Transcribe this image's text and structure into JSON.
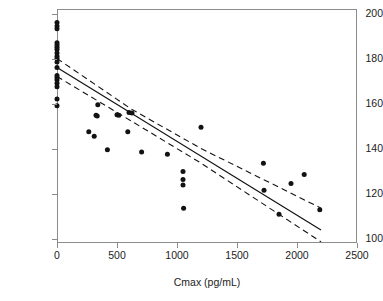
{
  "figure": {
    "title": "",
    "background": "#ffffff"
  },
  "axes": {
    "x": {
      "label": "Cmax (pg/mL)",
      "ticks": [
        0,
        500,
        1000,
        1500,
        2000,
        2500
      ],
      "tick_labels": [
        "0",
        "500",
        "1000",
        "1500",
        "2000",
        "2500"
      ],
      "min": 0,
      "max": 2500
    },
    "y": {
      "label": "Glucose level (mg/dL)",
      "ticks": [
        100,
        120,
        140,
        160,
        180,
        200
      ],
      "tick_labels": [
        "100",
        "120",
        "140",
        "160",
        "180",
        "200"
      ],
      "min": 98,
      "max": 202
    }
  },
  "chart_data": {
    "type": "scatter",
    "title": "",
    "xlabel": "Cmax (pg/mL)",
    "ylabel": "Glucose level (mg/dL)",
    "xlim": [
      0,
      2500
    ],
    "ylim": [
      98,
      202
    ],
    "grid": false,
    "legend": null,
    "marker_color": "#121212",
    "line_color": "#121212",
    "points": [
      {
        "x": 0,
        "y": 196.0
      },
      {
        "x": 0,
        "y": 194.5
      },
      {
        "x": 0,
        "y": 193.2
      },
      {
        "x": 0,
        "y": 187.0
      },
      {
        "x": 0,
        "y": 186.0
      },
      {
        "x": 0,
        "y": 185.0
      },
      {
        "x": 0,
        "y": 184.0
      },
      {
        "x": 0,
        "y": 182.5
      },
      {
        "x": 0,
        "y": 181.0
      },
      {
        "x": 0,
        "y": 180.0
      },
      {
        "x": 0,
        "y": 178.5
      },
      {
        "x": 0,
        "y": 176.0
      },
      {
        "x": 0,
        "y": 172.5
      },
      {
        "x": 0,
        "y": 171.5
      },
      {
        "x": 0,
        "y": 170.5
      },
      {
        "x": 0,
        "y": 169.0
      },
      {
        "x": 0,
        "y": 167.5
      },
      {
        "x": 0,
        "y": 162.0
      },
      {
        "x": 0,
        "y": 159.0
      },
      {
        "x": 265,
        "y": 147.5
      },
      {
        "x": 310,
        "y": 145.5
      },
      {
        "x": 325,
        "y": 154.8
      },
      {
        "x": 335,
        "y": 154.5
      },
      {
        "x": 340,
        "y": 159.5
      },
      {
        "x": 420,
        "y": 139.5
      },
      {
        "x": 500,
        "y": 155.0
      },
      {
        "x": 515,
        "y": 154.8
      },
      {
        "x": 590,
        "y": 147.5
      },
      {
        "x": 600,
        "y": 156.0
      },
      {
        "x": 625,
        "y": 155.8
      },
      {
        "x": 705,
        "y": 138.5
      },
      {
        "x": 920,
        "y": 137.5
      },
      {
        "x": 1050,
        "y": 129.8
      },
      {
        "x": 1050,
        "y": 126.2
      },
      {
        "x": 1050,
        "y": 123.8
      },
      {
        "x": 1055,
        "y": 113.5
      },
      {
        "x": 1200,
        "y": 149.5
      },
      {
        "x": 1720,
        "y": 133.5
      },
      {
        "x": 1725,
        "y": 121.5
      },
      {
        "x": 1850,
        "y": 110.8
      },
      {
        "x": 1950,
        "y": 124.5
      },
      {
        "x": 2060,
        "y": 128.5
      },
      {
        "x": 2190,
        "y": 112.8
      }
    ],
    "fit_line": {
      "style": "solid",
      "points": [
        {
          "x": 0,
          "y": 176.0
        },
        {
          "x": 2200,
          "y": 103.8
        }
      ],
      "slope_per_1000": -32.8,
      "intercept": 176.0
    },
    "confidence_bands": [
      {
        "name": "upper",
        "style": "dashed",
        "points": [
          {
            "x": 0,
            "y": 180.0
          },
          {
            "x": 620,
            "y": 157.5
          },
          {
            "x": 1200,
            "y": 140.0
          },
          {
            "x": 2200,
            "y": 113.5
          }
        ]
      },
      {
        "name": "lower",
        "style": "dashed",
        "points": [
          {
            "x": 0,
            "y": 172.0
          },
          {
            "x": 620,
            "y": 152.2
          },
          {
            "x": 1200,
            "y": 133.5
          },
          {
            "x": 2200,
            "y": 98.5
          }
        ]
      }
    ]
  }
}
